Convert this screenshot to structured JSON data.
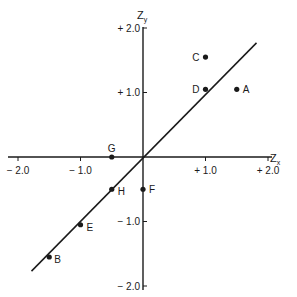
{
  "chart_data": {
    "type": "scatter",
    "title": "",
    "xlabel": "Z_x",
    "ylabel": "Z_y",
    "xlim": [
      -2.0,
      2.0
    ],
    "ylim": [
      -2.0,
      2.0
    ],
    "x_ticks": [
      "-2.0",
      "-1.0",
      "+1.0",
      "+2.0"
    ],
    "y_ticks": [
      "+2.0",
      "+1.0",
      "-1.0",
      "-2.0"
    ],
    "grid": false,
    "points": [
      {
        "label": "A",
        "x": 1.5,
        "y": 1.05
      },
      {
        "label": "B",
        "x": -1.5,
        "y": -1.55
      },
      {
        "label": "C",
        "x": 1.0,
        "y": 1.55
      },
      {
        "label": "D",
        "x": 1.0,
        "y": 1.05
      },
      {
        "label": "E",
        "x": -1.0,
        "y": -1.05
      },
      {
        "label": "F",
        "x": 0.0,
        "y": -0.5
      },
      {
        "label": "G",
        "x": -0.5,
        "y": 0.0
      },
      {
        "label": "H",
        "x": -0.5,
        "y": -0.5
      }
    ],
    "fit_line": {
      "slope": 1.0,
      "intercept": 0.0,
      "x_range": [
        -1.8,
        1.8
      ]
    }
  },
  "labels": {
    "x_axis_main": "Z",
    "x_axis_sub": "x",
    "y_axis_main": "Z",
    "y_axis_sub": "y"
  }
}
